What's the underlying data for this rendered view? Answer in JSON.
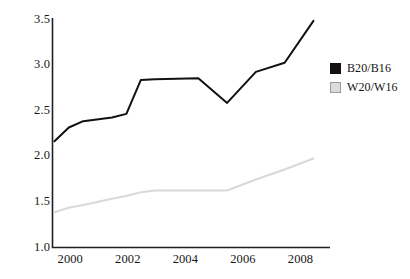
{
  "chart_data": {
    "type": "line",
    "title": "",
    "xlabel": "",
    "ylabel": "",
    "xlim": [
      1999.4,
      2008.4
    ],
    "ylim": [
      1.0,
      3.5
    ],
    "grid": false,
    "legend_position": "right",
    "xticks": [
      2000,
      2002,
      2004,
      2006,
      2008
    ],
    "xtick_labels": [
      "2000",
      "2002",
      "2004",
      "2006",
      "2008"
    ],
    "yticks": [
      1.0,
      1.5,
      2.0,
      2.5,
      3.0,
      3.5
    ],
    "ytick_labels": [
      "1.0",
      "1.5",
      "2.0",
      "2.5",
      "3.0",
      "3.5"
    ],
    "x": [
      1999.45,
      1999.95,
      2000.45,
      2001.45,
      2001.95,
      2002.45,
      2002.95,
      2004.45,
      2005.45,
      2006.45,
      2007.45,
      2008.45
    ],
    "series": [
      {
        "name": "B20/B16",
        "color": "#111111",
        "values": [
          2.16,
          2.31,
          2.38,
          2.42,
          2.46,
          2.83,
          2.84,
          2.85,
          2.58,
          2.92,
          3.02,
          3.48
        ]
      },
      {
        "name": "W20/W16",
        "color": "#d9d9d9",
        "values": [
          1.38,
          1.43,
          1.46,
          1.53,
          1.56,
          1.6,
          1.62,
          1.62,
          1.62,
          1.74,
          1.85,
          1.97
        ]
      }
    ]
  },
  "legend": {
    "items": [
      {
        "label": "B20/B16",
        "swatch": "#111111",
        "border": "#111111"
      },
      {
        "label": "W20/W16",
        "swatch": "#dcdcdc",
        "border": "#9a9a9a"
      }
    ]
  },
  "axes": {
    "axis_color": "#1f1f1f",
    "background": "#ffffff"
  }
}
